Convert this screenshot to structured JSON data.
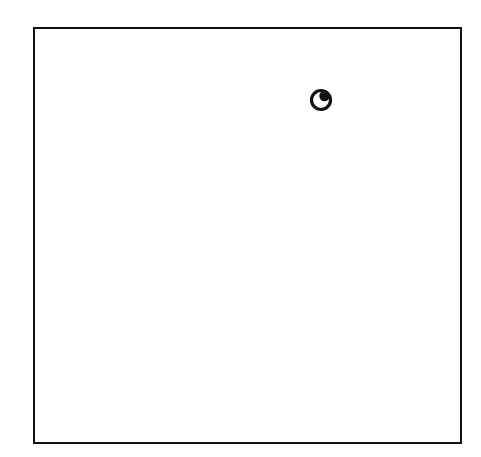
{
  "canvas": {
    "background": "#ffffff",
    "frame_color": "#111111"
  },
  "figure": {
    "shape": "square-frame",
    "icon": "eye-icon"
  }
}
